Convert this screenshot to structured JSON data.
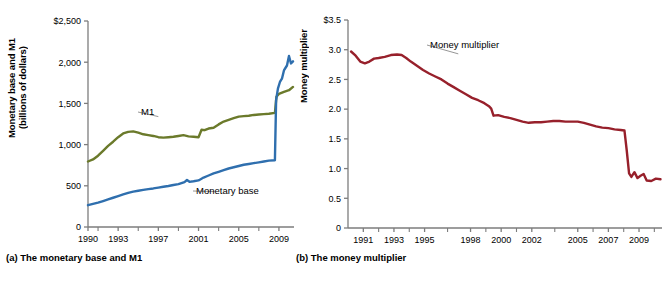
{
  "figure": {
    "background": "#ffffff"
  },
  "panel_a": {
    "caption": "(a) The monetary base and M1",
    "ylabel_line1": "Monetary base and M1",
    "ylabel_line2": "(billions of dollars)"
  },
  "panel_b": {
    "caption": "(b) The money multiplier",
    "ylabel": "Money multiplier"
  },
  "chart_data": [
    {
      "id": "monetary-base-and-m1",
      "type": "line",
      "title": "(a) The monetary base and M1",
      "xlabel": "",
      "ylabel": "Monetary base and M1 (billions of dollars)",
      "ylim": [
        0,
        2500
      ],
      "xlim": [
        1990,
        2010.5
      ],
      "grid": false,
      "legend": "inline-annotations",
      "ytick_labels": [
        "$2,500",
        "2,000",
        "1,500",
        "1,000",
        "500",
        "0"
      ],
      "ytick_values": [
        2500,
        2000,
        1500,
        1000,
        500,
        0
      ],
      "xtick_labels": [
        "1990",
        "1993",
        "1997",
        "2001",
        "2005",
        "2009"
      ],
      "xtick_values": [
        1990,
        1993,
        1997,
        2001,
        2005,
        2009
      ],
      "minor_xtick_values": [
        1991,
        1995,
        1999,
        2003,
        2007
      ],
      "annotations": [
        {
          "text": "M1",
          "x": 1997.0,
          "y": 1340
        },
        {
          "text": "Monetary base",
          "x": 2002.6,
          "y": 430
        }
      ],
      "series": [
        {
          "name": "M1",
          "color": "#6b7a2b",
          "x": [
            1990.0,
            1990.5,
            1991.0,
            1991.5,
            1992.0,
            1992.5,
            1993.0,
            1993.5,
            1994.0,
            1994.5,
            1995.0,
            1995.5,
            1996.0,
            1996.5,
            1997.0,
            1997.5,
            1998.0,
            1998.5,
            1999.0,
            1999.5,
            2000.0,
            2000.5,
            2001.0,
            2001.3,
            2001.6,
            2002.0,
            2002.5,
            2003.0,
            2003.5,
            2004.0,
            2004.5,
            2005.0,
            2005.5,
            2006.0,
            2006.5,
            2007.0,
            2007.5,
            2008.0,
            2008.6,
            2008.75,
            2009.0,
            2009.5,
            2010.0,
            2010.4
          ],
          "values": [
            795,
            820,
            865,
            925,
            985,
            1035,
            1090,
            1135,
            1155,
            1160,
            1145,
            1125,
            1115,
            1105,
            1090,
            1085,
            1090,
            1095,
            1105,
            1115,
            1100,
            1095,
            1090,
            1180,
            1175,
            1195,
            1205,
            1245,
            1280,
            1300,
            1320,
            1340,
            1345,
            1350,
            1360,
            1365,
            1370,
            1375,
            1385,
            1580,
            1615,
            1640,
            1660,
            1700
          ]
        },
        {
          "name": "Monetary base",
          "color": "#2f6fae",
          "x": [
            1990.0,
            1990.5,
            1991.0,
            1991.5,
            1992.0,
            1992.5,
            1993.0,
            1993.5,
            1994.0,
            1994.5,
            1995.0,
            1995.5,
            1996.0,
            1996.5,
            1997.0,
            1997.5,
            1998.0,
            1998.5,
            1999.0,
            1999.6,
            1999.85,
            2000.1,
            2000.5,
            2001.0,
            2001.5,
            2002.0,
            2002.5,
            2003.0,
            2003.5,
            2004.0,
            2004.5,
            2005.0,
            2005.5,
            2006.0,
            2006.5,
            2007.0,
            2007.5,
            2008.0,
            2008.6,
            2008.72,
            2008.9,
            2009.1,
            2009.3,
            2009.5,
            2009.8,
            2010.0,
            2010.2,
            2010.4
          ],
          "values": [
            265,
            280,
            295,
            315,
            335,
            355,
            375,
            395,
            415,
            430,
            440,
            450,
            460,
            468,
            478,
            488,
            498,
            510,
            520,
            545,
            570,
            548,
            555,
            565,
            600,
            625,
            650,
            670,
            690,
            710,
            725,
            740,
            755,
            765,
            775,
            785,
            795,
            805,
            810,
            1540,
            1680,
            1760,
            1800,
            1900,
            1960,
            2075,
            1985,
            2010
          ]
        }
      ]
    },
    {
      "id": "money-multiplier",
      "type": "line",
      "title": "(b) The money multiplier",
      "xlabel": "",
      "ylabel": "Money multiplier",
      "ylim": [
        0,
        3.5
      ],
      "xlim": [
        1990,
        2010.5
      ],
      "grid": false,
      "legend": "inline-annotations",
      "ytick_labels": [
        "$3.5",
        "3.0",
        "2.5",
        "2.0",
        "1.5",
        "1.0",
        "0.5",
        "0"
      ],
      "ytick_values": [
        3.5,
        3.0,
        2.5,
        2.0,
        1.5,
        1.0,
        0.5,
        0
      ],
      "xtick_labels": [
        "1991",
        "1993",
        "1995",
        "1998",
        "2000",
        "2002",
        "2005",
        "2007",
        "2009"
      ],
      "xtick_values": [
        1991,
        1993,
        1995,
        1998,
        2000,
        2002,
        2005,
        2007,
        2009
      ],
      "minor_xtick_values": [
        1992,
        1994,
        1996.5,
        1999,
        2001,
        2003.5,
        2006,
        2008,
        2010
      ],
      "annotations": [
        {
          "text": "Money multiplier",
          "x": 1997.2,
          "y": 2.93
        }
      ],
      "series": [
        {
          "name": "Money multiplier",
          "color": "#97202b",
          "x": [
            1990.2,
            1990.5,
            1990.8,
            1991.1,
            1991.4,
            1991.7,
            1992.0,
            1992.4,
            1992.8,
            1993.2,
            1993.5,
            1993.8,
            1994.1,
            1994.5,
            1994.9,
            1995.3,
            1995.7,
            1996.1,
            1996.5,
            1996.9,
            1997.3,
            1997.7,
            1998.1,
            1998.5,
            1998.9,
            1999.2,
            1999.35,
            1999.5,
            1999.8,
            2000.2,
            2000.6,
            2001.0,
            2001.4,
            2001.8,
            2002.2,
            2002.6,
            2003.0,
            2003.4,
            2003.8,
            2004.2,
            2004.6,
            2005.0,
            2005.4,
            2005.8,
            2006.2,
            2006.6,
            2007.0,
            2007.4,
            2007.8,
            2008.05,
            2008.2,
            2008.35,
            2008.5,
            2008.7,
            2008.9,
            2009.1,
            2009.3,
            2009.5,
            2009.8,
            2010.1,
            2010.4
          ],
          "values": [
            2.97,
            2.9,
            2.8,
            2.77,
            2.8,
            2.85,
            2.86,
            2.88,
            2.91,
            2.92,
            2.91,
            2.86,
            2.8,
            2.73,
            2.66,
            2.6,
            2.55,
            2.5,
            2.43,
            2.37,
            2.31,
            2.25,
            2.19,
            2.15,
            2.1,
            2.05,
            2.01,
            1.89,
            1.9,
            1.87,
            1.85,
            1.82,
            1.79,
            1.77,
            1.78,
            1.78,
            1.79,
            1.8,
            1.8,
            1.79,
            1.79,
            1.79,
            1.77,
            1.74,
            1.71,
            1.69,
            1.68,
            1.66,
            1.65,
            1.64,
            1.3,
            0.92,
            0.86,
            0.94,
            0.84,
            0.88,
            0.91,
            0.8,
            0.79,
            0.83,
            0.82
          ]
        }
      ]
    }
  ]
}
